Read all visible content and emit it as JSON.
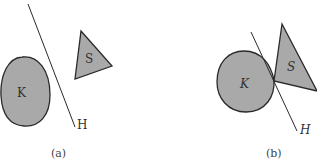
{
  "panels": [
    {
      "caption": "(a)",
      "convex_set_label": "K",
      "triangle_label": "S",
      "hyperplane_label": "H"
    },
    {
      "caption": "(b)",
      "convex_set_label": "K",
      "triangle_label": "S",
      "hyperplane_label": "H"
    }
  ],
  "colors": {
    "fill": "#a9a9a9",
    "stroke": "#2a2a2a"
  }
}
